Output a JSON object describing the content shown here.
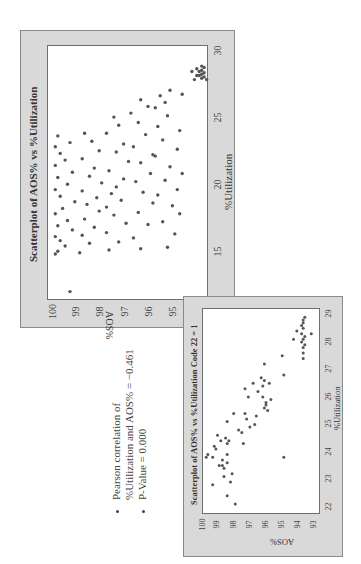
{
  "orientation": "figure rotated 90 degrees counter-clockwise",
  "main_chart": {
    "title": "Scatterplot of AOS% vs %Utilization",
    "xlabel": "%Utilization",
    "ylabel": "AOS%",
    "x_ticks": [
      "15",
      "20",
      "25",
      "30"
    ],
    "y_ticks": [
      "100",
      "99",
      "98",
      "97",
      "96",
      "95",
      "94"
    ]
  },
  "inset_chart": {
    "title": "Scatterplot of AOS% vs %Utilization Code 22 = 1",
    "xlabel": "%Utilization",
    "ylabel": "AOS%",
    "x_ticks": [
      "22",
      "23",
      "24",
      "25",
      "26",
      "27",
      "28",
      "29"
    ],
    "y_ticks": [
      "100",
      "99",
      "98",
      "97",
      "96",
      "95",
      "94",
      "93"
    ]
  },
  "notes": {
    "bullet_1_line_1": "Pearson correlation of",
    "bullet_1_line_2": "%Utilization and AOS% = −0.461",
    "bullet_2": "P-Value = 0.000"
  },
  "chart_data": [
    {
      "type": "scatter",
      "title": "Scatterplot of AOS% vs %Utilization",
      "xlabel": "%Utilization",
      "ylabel": "AOS%",
      "xlim": [
        11.5,
        30.5
      ],
      "ylim": [
        93.7,
        100.3
      ],
      "x_ticks": [
        15,
        20,
        25,
        30
      ],
      "y_ticks": [
        94,
        95,
        96,
        97,
        98,
        99,
        100
      ],
      "grid": false,
      "note": "Approximately 350 points; dense cloud between 15-24 %Utilization spanning AOS% 95-100, with a downward trend and a tight cluster near %Utilization 28-29 at AOS% 93.8-94.4. Points below are a representative sample.",
      "points": [
        [
          12.2,
          99.4
        ],
        [
          15.0,
          100.0
        ],
        [
          15.2,
          99.9
        ],
        [
          15.6,
          99.6
        ],
        [
          16.0,
          99.8
        ],
        [
          16.3,
          100.0
        ],
        [
          16.8,
          99.3
        ],
        [
          17.1,
          99.9
        ],
        [
          17.5,
          99.5
        ],
        [
          18.0,
          100.0
        ],
        [
          18.4,
          99.7
        ],
        [
          18.9,
          99.2
        ],
        [
          19.3,
          99.8
        ],
        [
          19.8,
          100.0
        ],
        [
          20.2,
          99.5
        ],
        [
          20.7,
          99.9
        ],
        [
          21.1,
          99.3
        ],
        [
          21.6,
          100.0
        ],
        [
          22.0,
          99.6
        ],
        [
          22.5,
          99.8
        ],
        [
          23.0,
          100.0
        ],
        [
          23.3,
          99.4
        ],
        [
          23.8,
          99.9
        ],
        [
          15.1,
          99.0
        ],
        [
          15.8,
          98.6
        ],
        [
          16.4,
          98.9
        ],
        [
          17.0,
          98.4
        ],
        [
          17.6,
          98.8
        ],
        [
          18.2,
          98.2
        ],
        [
          18.7,
          98.7
        ],
        [
          19.2,
          98.3
        ],
        [
          19.7,
          98.9
        ],
        [
          20.3,
          98.1
        ],
        [
          20.8,
          98.6
        ],
        [
          21.4,
          98.4
        ],
        [
          22.1,
          98.9
        ],
        [
          22.7,
          98.2
        ],
        [
          23.4,
          98.5
        ],
        [
          24.0,
          98.8
        ],
        [
          15.3,
          97.8
        ],
        [
          15.9,
          97.4
        ],
        [
          16.6,
          97.9
        ],
        [
          17.3,
          97.1
        ],
        [
          17.9,
          97.6
        ],
        [
          18.5,
          97.9
        ],
        [
          19.0,
          97.3
        ],
        [
          19.5,
          97.7
        ],
        [
          20.0,
          97.5
        ],
        [
          20.6,
          97.2
        ],
        [
          21.2,
          97.8
        ],
        [
          21.9,
          97.0
        ],
        [
          22.6,
          97.5
        ],
        [
          23.2,
          97.2
        ],
        [
          24.0,
          97.9
        ],
        [
          24.6,
          97.4
        ],
        [
          25.2,
          97.6
        ],
        [
          15.4,
          96.5
        ],
        [
          16.2,
          96.8
        ],
        [
          17.2,
          96.2
        ],
        [
          18.1,
          96.6
        ],
        [
          18.8,
          96.0
        ],
        [
          19.6,
          96.4
        ],
        [
          20.4,
          96.7
        ],
        [
          21.0,
          96.1
        ],
        [
          21.8,
          96.5
        ],
        [
          22.4,
          96.0
        ],
        [
          23.0,
          96.8
        ],
        [
          23.9,
          96.3
        ],
        [
          24.8,
          96.6
        ],
        [
          25.5,
          96.9
        ],
        [
          26.0,
          96.2
        ],
        [
          26.5,
          96.5
        ],
        [
          15.5,
          95.4
        ],
        [
          16.5,
          95.1
        ],
        [
          17.4,
          95.6
        ],
        [
          18.6,
          95.2
        ],
        [
          19.4,
          95.8
        ],
        [
          20.5,
          95.5
        ],
        [
          21.5,
          95.3
        ],
        [
          22.3,
          95.9
        ],
        [
          23.5,
          95.6
        ],
        [
          24.5,
          95.8
        ],
        [
          25.3,
          95.4
        ],
        [
          25.9,
          95.9
        ],
        [
          26.3,
          95.5
        ],
        [
          26.8,
          95.7
        ],
        [
          27.2,
          95.3
        ],
        [
          18.0,
          94.9
        ],
        [
          19.8,
          95.0
        ],
        [
          21.0,
          94.8
        ],
        [
          22.8,
          95.0
        ],
        [
          24.2,
          94.9
        ],
        [
          26.9,
          94.8
        ],
        [
          28.0,
          94.3
        ],
        [
          28.1,
          94.0
        ],
        [
          28.2,
          93.9
        ],
        [
          28.3,
          94.1
        ],
        [
          28.3,
          94.2
        ],
        [
          28.4,
          94.0
        ],
        [
          28.5,
          93.9
        ],
        [
          28.6,
          94.1
        ],
        [
          28.7,
          94.0
        ],
        [
          28.8,
          94.2
        ],
        [
          28.9,
          93.9
        ],
        [
          29.0,
          94.0
        ],
        [
          28.6,
          94.4
        ],
        [
          28.0,
          93.8
        ]
      ]
    },
    {
      "type": "scatter",
      "title": "Scatterplot of AOS% vs %Utilization Code 22 = 1",
      "xlabel": "%Utilization",
      "ylabel": "AOS%",
      "xlim": [
        21.8,
        29.3
      ],
      "ylim": [
        92.9,
        100.2
      ],
      "x_ticks": [
        22,
        23,
        24,
        25,
        26,
        27,
        28,
        29
      ],
      "y_ticks": [
        93,
        94,
        95,
        96,
        97,
        98,
        99,
        100
      ],
      "grid": false,
      "points": [
        [
          22.2,
          98.2
        ],
        [
          22.5,
          98.7
        ],
        [
          22.9,
          99.6
        ],
        [
          23.0,
          98.5
        ],
        [
          23.2,
          98.9
        ],
        [
          23.3,
          98.4
        ],
        [
          23.5,
          98.9
        ],
        [
          23.6,
          99.0
        ],
        [
          23.6,
          99.2
        ],
        [
          23.7,
          98.7
        ],
        [
          23.8,
          99.0
        ],
        [
          23.9,
          100.0
        ],
        [
          23.9,
          99.6
        ],
        [
          24.0,
          99.9
        ],
        [
          24.0,
          98.7
        ],
        [
          24.2,
          99.4
        ],
        [
          24.3,
          99.5
        ],
        [
          24.4,
          98.7
        ],
        [
          24.4,
          97.7
        ],
        [
          24.5,
          98.6
        ],
        [
          24.5,
          99.1
        ],
        [
          24.6,
          98.8
        ],
        [
          24.7,
          99.3
        ],
        [
          24.8,
          97.8
        ],
        [
          24.9,
          98.0
        ],
        [
          25.0,
          97.3
        ],
        [
          25.1,
          97.0
        ],
        [
          25.2,
          98.7
        ],
        [
          25.3,
          97.5
        ],
        [
          25.4,
          96.9
        ],
        [
          25.5,
          97.6
        ],
        [
          25.5,
          98.3
        ],
        [
          25.6,
          96.2
        ],
        [
          25.7,
          96.4
        ],
        [
          25.8,
          96.3
        ],
        [
          25.9,
          96.3
        ],
        [
          26.0,
          96.0
        ],
        [
          26.1,
          96.5
        ],
        [
          26.1,
          97.4
        ],
        [
          26.3,
          96.8
        ],
        [
          26.4,
          97.6
        ],
        [
          26.5,
          96.5
        ],
        [
          26.6,
          96.1
        ],
        [
          26.6,
          97.1
        ],
        [
          26.7,
          96.4
        ],
        [
          26.8,
          96.6
        ],
        [
          26.9,
          95.2
        ],
        [
          27.3,
          96.4
        ],
        [
          27.6,
          95.3
        ],
        [
          23.9,
          95.2
        ],
        [
          27.5,
          94.0
        ],
        [
          27.7,
          94.0
        ],
        [
          27.9,
          94.0
        ],
        [
          28.0,
          93.9
        ],
        [
          28.1,
          94.1
        ],
        [
          28.2,
          94.0
        ],
        [
          28.3,
          93.9
        ],
        [
          28.4,
          94.1
        ],
        [
          28.5,
          94.4
        ],
        [
          28.6,
          94.0
        ],
        [
          28.7,
          94.1
        ],
        [
          28.8,
          94.0
        ],
        [
          28.9,
          94.0
        ],
        [
          29.0,
          93.9
        ],
        [
          28.2,
          94.6
        ],
        [
          28.4,
          93.5
        ]
      ]
    }
  ]
}
